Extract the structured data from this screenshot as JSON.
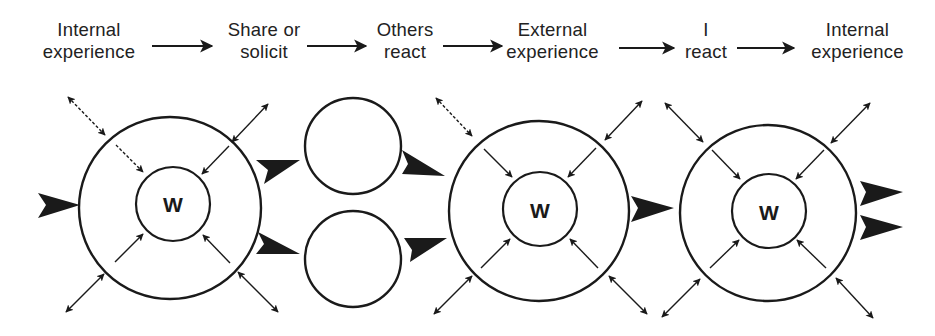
{
  "diagram": {
    "type": "process-flow",
    "stages": [
      {
        "line1": "Internal",
        "line2": "experience"
      },
      {
        "line1": "Share or",
        "line2": "solicit"
      },
      {
        "line1": "Others",
        "line2": "react"
      },
      {
        "line1": "External",
        "line2": "experience"
      },
      {
        "line1": "I",
        "line2": "react"
      },
      {
        "line1": "Internal",
        "line2": "experience"
      }
    ],
    "nodes": [
      {
        "id": "self-1",
        "inner_label": "W"
      },
      {
        "id": "other-top",
        "inner_label": ""
      },
      {
        "id": "other-bottom",
        "inner_label": ""
      },
      {
        "id": "self-2",
        "inner_label": "W"
      },
      {
        "id": "self-3",
        "inner_label": "W"
      }
    ],
    "colors": {
      "ink": "#1a1a1a",
      "background": "#ffffff"
    }
  }
}
